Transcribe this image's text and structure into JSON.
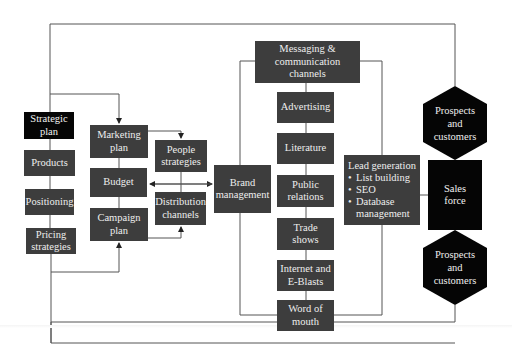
{
  "diagram": {
    "type": "marketing process flow",
    "colors": {
      "box_fill": "#3d3d3d",
      "emphasis_fill": "#050505",
      "text": "#eeeeee",
      "line": "#444444",
      "background": "#ffffff"
    },
    "strategy_column": {
      "strategic_plan": "Strategic plan",
      "products": "Products",
      "positioning": "Positioning",
      "pricing": "Pricing strategies"
    },
    "planning_column": {
      "marketing_plan": "Marketing plan",
      "budget": "Budget",
      "campaign_plan": "Campaign plan"
    },
    "support_column": {
      "people": "People strategies",
      "distribution": "Distribution channels"
    },
    "brand": "Brand management",
    "channels": {
      "header": "Messaging & communication channels",
      "items": [
        "Advertising",
        "Literature",
        "Public relations",
        "Trade shows",
        "Internet and E-Blasts",
        "Word of mouth"
      ]
    },
    "lead_generation": {
      "title": "Lead generation",
      "bullets": [
        "List building",
        "SEO",
        "Database management"
      ]
    },
    "sales": {
      "top": "Prospects and customers",
      "center": "Sales force",
      "bottom": "Prospects and customers"
    }
  }
}
